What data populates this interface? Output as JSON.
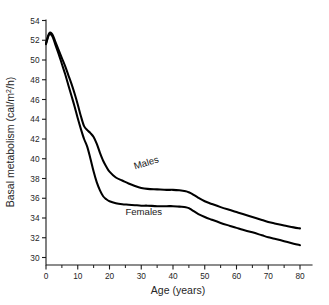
{
  "chart_data": {
    "type": "line",
    "title": "",
    "xlabel": "Age (years)",
    "ylabel": "Basal metabolism (cal/m²/h)",
    "ylabel_main": "Basal metabolism (cal/m",
    "ylabel_sup": "2",
    "ylabel_tail": "/h)",
    "xlim": [
      0,
      80
    ],
    "ylim": [
      29,
      54.5
    ],
    "grid": false,
    "legend_position": "inline-annotation",
    "x_ticks_major": [
      0,
      10,
      20,
      30,
      40,
      50,
      60,
      70,
      80
    ],
    "x_ticks_minor": [
      5,
      15,
      25,
      35,
      45,
      55,
      65,
      75
    ],
    "y_ticks_major": [
      30,
      32,
      34,
      36,
      38,
      40,
      42,
      44,
      46,
      48,
      50,
      52,
      54
    ],
    "x_tick_labels": [
      "0",
      "10",
      "20",
      "30",
      "40",
      "50",
      "60",
      "70",
      "80"
    ],
    "y_tick_labels": [
      "30",
      "32",
      "34",
      "36",
      "38",
      "40",
      "42",
      "44",
      "46",
      "48",
      "50",
      "52",
      "54"
    ],
    "series": [
      {
        "name": "Males",
        "label": "Males",
        "color": "#000000",
        "label_x": 28,
        "label_y": 38.9,
        "label_rotation": -17,
        "x": [
          0,
          1,
          2,
          3,
          4,
          5,
          6,
          7,
          8,
          9,
          10,
          11,
          12,
          13,
          14,
          15,
          16,
          17,
          18,
          19,
          20,
          22,
          24,
          26,
          28,
          30,
          32,
          35,
          38,
          40,
          42,
          44,
          45,
          46,
          48,
          50,
          52,
          55,
          58,
          60,
          62,
          65,
          68,
          70,
          72,
          75,
          78,
          80
        ],
        "values": [
          51.7,
          52.7,
          52.6,
          51.8,
          51.0,
          50.2,
          49.4,
          48.5,
          47.6,
          46.6,
          45.5,
          44.3,
          43.3,
          42.9,
          42.6,
          42.2,
          41.5,
          40.6,
          39.8,
          39.2,
          38.7,
          38.1,
          37.8,
          37.5,
          37.25,
          37.05,
          36.95,
          36.9,
          36.85,
          36.85,
          36.8,
          36.7,
          36.6,
          36.45,
          36.05,
          35.7,
          35.45,
          35.1,
          34.8,
          34.6,
          34.4,
          34.1,
          33.8,
          33.6,
          33.45,
          33.25,
          33.05,
          32.95
        ]
      },
      {
        "name": "Females",
        "label": "Females",
        "color": "#000000",
        "label_x": 25,
        "label_y": 34.3,
        "label_rotation": 0,
        "x": [
          0,
          1,
          2,
          3,
          4,
          5,
          6,
          7,
          8,
          9,
          10,
          11,
          12,
          13,
          14,
          15,
          16,
          17,
          18,
          19,
          20,
          22,
          24,
          26,
          28,
          30,
          32,
          35,
          38,
          40,
          42,
          44,
          45,
          46,
          48,
          50,
          52,
          55,
          58,
          60,
          62,
          65,
          68,
          70,
          72,
          75,
          78,
          80
        ],
        "values": [
          51.6,
          52.6,
          52.4,
          51.5,
          50.6,
          49.6,
          48.6,
          47.5,
          46.4,
          45.3,
          44.1,
          43.0,
          42.0,
          41.2,
          40.0,
          38.7,
          37.6,
          36.8,
          36.2,
          35.9,
          35.7,
          35.5,
          35.4,
          35.35,
          35.3,
          35.25,
          35.25,
          35.2,
          35.2,
          35.2,
          35.15,
          35.1,
          35.0,
          34.8,
          34.4,
          34.1,
          33.85,
          33.5,
          33.2,
          33.0,
          32.8,
          32.55,
          32.25,
          32.05,
          31.9,
          31.65,
          31.4,
          31.25
        ]
      }
    ]
  }
}
